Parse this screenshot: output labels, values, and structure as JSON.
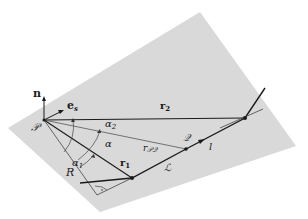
{
  "diagram": {
    "plane_color": "#d9d9d9",
    "line_color": "#1a1a1a",
    "thin_line_color": "#444444",
    "labels": {
      "n": "n",
      "e_s": "e",
      "e_s_sub": "s",
      "P": "𝒫",
      "Q": "𝒬",
      "L": "ℒ",
      "r1": "r",
      "r1_sub": "1",
      "r2": "r",
      "r2_sub": "2",
      "rPQ": "r",
      "rPQ_sub": "𝒫𝒬",
      "alpha": "α",
      "alpha1": "α",
      "alpha1_sub": "1",
      "alpha2": "α",
      "alpha2_sub": "2",
      "R": "R",
      "l": "l"
    }
  }
}
